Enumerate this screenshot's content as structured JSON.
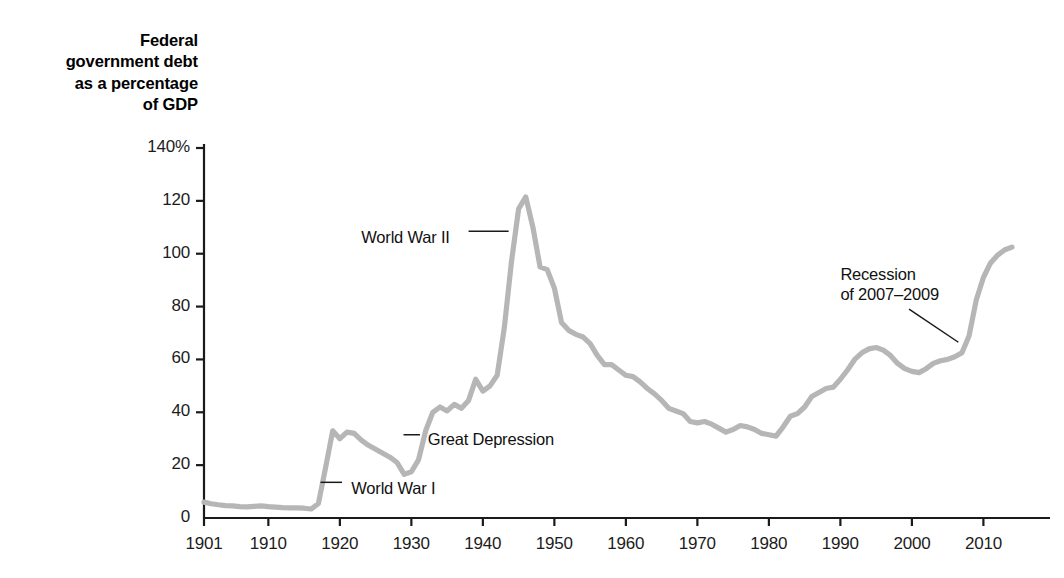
{
  "figure": {
    "axis_title": "Federal\ngovernment debt\nas a percentage\nof GDP",
    "line_color": "#b6b6b6",
    "axis_color": "#1a1a1a",
    "background": "#ffffff"
  },
  "chart_data": {
    "type": "line",
    "title": "Federal government debt as a percentage of GDP",
    "xlabel": "",
    "ylabel": "Federal government debt as a percentage of GDP",
    "xlim": [
      1901,
      2014
    ],
    "ylim": [
      0,
      140
    ],
    "grid": false,
    "legend": null,
    "ytick_labels": [
      "0",
      "20",
      "40",
      "60",
      "80",
      "100",
      "120",
      "140%"
    ],
    "yticks": [
      0,
      20,
      40,
      60,
      80,
      100,
      120,
      140
    ],
    "xtick_labels": [
      "1901",
      "1910",
      "1920",
      "1930",
      "1940",
      "1950",
      "1960",
      "1970",
      "1980",
      "1990",
      "2000",
      "2010"
    ],
    "xticks": [
      1901,
      1910,
      1920,
      1930,
      1940,
      1950,
      1960,
      1970,
      1980,
      1990,
      2000,
      2010
    ],
    "series": [
      {
        "name": "Federal debt held as percentage of GDP",
        "x": [
          1901,
          1902,
          1903,
          1904,
          1905,
          1906,
          1907,
          1908,
          1909,
          1910,
          1911,
          1912,
          1913,
          1914,
          1915,
          1916,
          1917,
          1918,
          1919,
          1920,
          1921,
          1922,
          1923,
          1924,
          1925,
          1926,
          1927,
          1928,
          1929,
          1930,
          1931,
          1932,
          1933,
          1934,
          1935,
          1936,
          1937,
          1938,
          1939,
          1940,
          1941,
          1942,
          1943,
          1944,
          1945,
          1946,
          1947,
          1948,
          1949,
          1950,
          1951,
          1952,
          1953,
          1954,
          1955,
          1956,
          1957,
          1958,
          1959,
          1960,
          1961,
          1962,
          1963,
          1964,
          1965,
          1966,
          1967,
          1968,
          1969,
          1970,
          1971,
          1972,
          1973,
          1974,
          1975,
          1976,
          1977,
          1978,
          1979,
          1980,
          1981,
          1982,
          1983,
          1984,
          1985,
          1986,
          1987,
          1988,
          1989,
          1990,
          1991,
          1992,
          1993,
          1994,
          1995,
          1996,
          1997,
          1998,
          1999,
          2000,
          2001,
          2002,
          2003,
          2004,
          2005,
          2006,
          2007,
          2008,
          2009,
          2010,
          2011,
          2012,
          2013,
          2014
        ],
        "y": [
          6.0,
          5.4,
          5.0,
          4.7,
          4.6,
          4.3,
          4.2,
          4.4,
          4.6,
          4.3,
          4.1,
          3.9,
          3.8,
          3.8,
          3.7,
          3.4,
          5.5,
          19.0,
          33.0,
          30.0,
          32.5,
          32.0,
          29.5,
          27.5,
          26.0,
          24.5,
          23.0,
          21.0,
          16.5,
          17.5,
          22.0,
          33.0,
          40.0,
          42.0,
          40.5,
          43.0,
          41.5,
          44.5,
          52.5,
          48.0,
          50.0,
          54.0,
          72.0,
          97.0,
          117.0,
          121.5,
          110.0,
          95.0,
          94.0,
          87.0,
          74.0,
          71.0,
          69.5,
          68.5,
          66.0,
          61.5,
          58.0,
          58.0,
          56.0,
          54.0,
          53.5,
          51.5,
          49.0,
          47.0,
          44.5,
          41.5,
          40.5,
          39.5,
          36.5,
          36.0,
          36.5,
          35.5,
          34.0,
          32.5,
          33.5,
          35.0,
          34.5,
          33.5,
          32.0,
          31.5,
          31.0,
          34.5,
          38.5,
          39.5,
          42.0,
          46.0,
          47.5,
          49.0,
          49.5,
          52.5,
          56.0,
          60.0,
          62.5,
          64.0,
          64.5,
          63.5,
          61.5,
          58.5,
          56.5,
          55.5,
          55.0,
          56.5,
          58.5,
          59.5,
          60.0,
          61.0,
          62.5,
          69.0,
          82.5,
          91.0,
          96.5,
          99.5,
          101.5,
          102.5
        ]
      }
    ],
    "annotations": [
      {
        "id": "world-war-i",
        "text": "World War I",
        "text_x": 1921.6,
        "text_y": 11.0,
        "leader_from": [
          1920.3,
          13.5
        ],
        "leader_to": [
          1917.3,
          13.5
        ]
      },
      {
        "id": "great-depression",
        "text": "Great Depression",
        "text_x": 1932.3,
        "text_y": 29.5,
        "leader_from": [
          1931.2,
          31.5
        ],
        "leader_to": [
          1928.9,
          31.5
        ]
      },
      {
        "id": "world-war-ii",
        "text": "World War II",
        "text_x": 1923.0,
        "text_y": 106.0,
        "leader_from": [
          1938.0,
          108.5
        ],
        "leader_to": [
          1943.6,
          108.5
        ]
      },
      {
        "id": "recession-2007-2009",
        "text": "Recession\nof 2007–2009",
        "text_x": 1990.0,
        "text_y": 92.0,
        "leader_from": [
          1999.6,
          79.0
        ],
        "leader_to": [
          2006.5,
          66.5
        ]
      }
    ]
  }
}
